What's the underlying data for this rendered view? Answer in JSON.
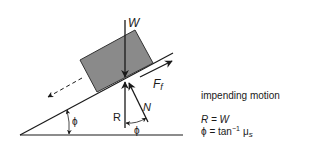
{
  "diagram": {
    "type": "free-body diagram on inclined plane",
    "labels": {
      "weight": "W",
      "friction": "F",
      "friction_sub": "f",
      "normal": "N",
      "reaction": "R",
      "angle_incline": "ϕ",
      "angle_between": "ϕ"
    },
    "caption": {
      "title": "impending motion",
      "eq1": "R = W",
      "eq2_lhs": "ϕ = tan",
      "eq2_exp": "−1",
      "eq2_mu": "μ",
      "eq2_sub": "s"
    },
    "colors": {
      "block": "#8a8a8a",
      "line": "#1a1a1a",
      "background": "#ffffff"
    }
  }
}
